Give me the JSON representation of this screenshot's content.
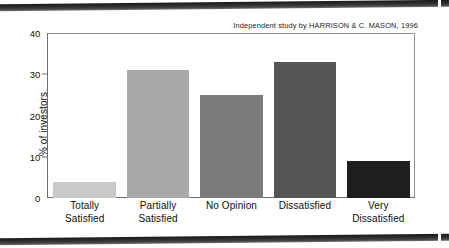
{
  "chart_data": {
    "type": "bar",
    "title": "",
    "annotation": "Independent study by HARRISON & C. MASON, 1996",
    "categories": [
      "Totally Satisfied",
      "Partially Satisfied",
      "No Opinion",
      "Dissatisfied",
      "Very Dissatisfied"
    ],
    "category_lines": [
      [
        "Totally",
        "Satisfied"
      ],
      [
        "Partially",
        "Satisfied"
      ],
      [
        "No Opinion",
        ""
      ],
      [
        "Dissatisfied",
        ""
      ],
      [
        "Very",
        "Dissatisfied"
      ]
    ],
    "values": [
      4,
      31,
      25,
      33,
      9
    ],
    "bar_colors": [
      "#c9c9c9",
      "#a8a8a8",
      "#7b7b7b",
      "#555555",
      "#1e1e1e"
    ],
    "xlabel": "",
    "ylabel": "% of investors",
    "ylim": [
      0,
      40
    ],
    "yticks": [
      0,
      10,
      20,
      30,
      40
    ],
    "ytick_labels": [
      "0",
      "10",
      "20",
      "30",
      "40"
    ],
    "grid": false,
    "legend": "none"
  },
  "figure": {
    "axis_color": "#6e6e6e",
    "background": "#ffffff"
  }
}
